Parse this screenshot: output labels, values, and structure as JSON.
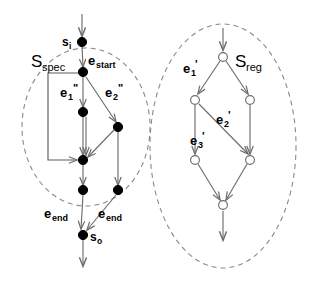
{
  "figure": {
    "type": "state-transition-graph-comparison",
    "background_color": "#ffffff",
    "edge_color": "#6d6d6d",
    "region_border_color": "#8a8a8a",
    "filled_node_color": "#000000",
    "hollow_node_fill": "#ffffff"
  },
  "regions": {
    "spec": {
      "label_main": "S",
      "label_sub": "spec",
      "node_style": "filled",
      "cx": 86,
      "cy": 127,
      "rx": 64,
      "ry": 79
    },
    "reg": {
      "label_main": "S",
      "label_sub": "reg",
      "node_style": "hollow",
      "cx": 223,
      "cy": 146,
      "rx": 73,
      "ry": 122
    }
  },
  "spec_graph": {
    "nodes": [
      {
        "id": "s_i",
        "x": 82,
        "y": 42,
        "style": "filled",
        "label_main": "s",
        "label_sub": "i"
      },
      {
        "id": "n_start",
        "x": 83,
        "y": 72,
        "style": "filled"
      },
      {
        "id": "n_l1",
        "x": 83,
        "y": 112,
        "style": "filled"
      },
      {
        "id": "n_r1",
        "x": 118,
        "y": 127,
        "style": "filled"
      },
      {
        "id": "n_merge",
        "x": 83,
        "y": 160,
        "style": "filled"
      },
      {
        "id": "n_l2",
        "x": 83,
        "y": 190,
        "style": "filled"
      },
      {
        "id": "n_r2",
        "x": 118,
        "y": 190,
        "style": "filled"
      },
      {
        "id": "s_o",
        "x": 83,
        "y": 235,
        "style": "filled",
        "label_main": "s",
        "label_sub": "o"
      }
    ],
    "edges": [
      {
        "from": "entry",
        "to": "s_i",
        "kind": "arrow"
      },
      {
        "from": "s_i",
        "to": "n_start",
        "kind": "arrow",
        "label_main": "e",
        "label_sub": "start"
      },
      {
        "from": "n_start",
        "to": "n_l1",
        "kind": "arrow",
        "label_main": "e",
        "label_sub": "1",
        "label_prime": "\""
      },
      {
        "from": "n_start",
        "to": "n_r1",
        "kind": "arrow",
        "label_main": "e",
        "label_sub": "2",
        "label_prime": "\""
      },
      {
        "from": "n_start",
        "to": "n_merge",
        "kind": "elbow-arrow"
      },
      {
        "from": "n_l1",
        "to": "n_merge",
        "kind": "arrow"
      },
      {
        "from": "n_r1",
        "to": "n_merge",
        "kind": "arrow"
      },
      {
        "from": "n_merge",
        "to": "n_l2",
        "kind": "arrow"
      },
      {
        "from": "n_r1",
        "to": "n_r2",
        "kind": "arrow"
      },
      {
        "from": "n_l2",
        "to": "s_o",
        "kind": "arrow",
        "label_main": "e",
        "label_sub": "end"
      },
      {
        "from": "n_r2",
        "to": "s_o",
        "kind": "arrow",
        "label_main": "e",
        "label_sub": "end"
      },
      {
        "from": "s_o",
        "to": "exit",
        "kind": "arrow"
      }
    ]
  },
  "reg_graph": {
    "nodes": [
      {
        "id": "r_top",
        "x": 223,
        "y": 57,
        "style": "hollow"
      },
      {
        "id": "r_left",
        "x": 195,
        "y": 100,
        "style": "hollow"
      },
      {
        "id": "r_right",
        "x": 250,
        "y": 100,
        "style": "hollow"
      },
      {
        "id": "r_bl",
        "x": 195,
        "y": 160,
        "style": "hollow"
      },
      {
        "id": "r_br",
        "x": 250,
        "y": 160,
        "style": "hollow"
      },
      {
        "id": "r_bot",
        "x": 223,
        "y": 205,
        "style": "hollow"
      }
    ],
    "edges": [
      {
        "from": "entry",
        "to": "r_top",
        "kind": "arrow"
      },
      {
        "from": "r_top",
        "to": "r_left",
        "kind": "arrow",
        "label_main": "e",
        "label_sub": "1",
        "label_prime": "'"
      },
      {
        "from": "r_top",
        "to": "r_right",
        "kind": "arrow"
      },
      {
        "from": "r_left",
        "to": "r_bl",
        "kind": "arrow",
        "label_main": "e",
        "label_sub": "3",
        "label_prime": "'"
      },
      {
        "from": "r_left",
        "to": "r_br",
        "kind": "arrow",
        "label_main": "e",
        "label_sub": "2",
        "label_prime": "'"
      },
      {
        "from": "r_right",
        "to": "r_br",
        "kind": "arrow"
      },
      {
        "from": "r_bl",
        "to": "r_bot",
        "kind": "arrow"
      },
      {
        "from": "r_br",
        "to": "r_bot",
        "kind": "arrow"
      },
      {
        "from": "r_bot",
        "to": "exit",
        "kind": "arrow"
      }
    ]
  },
  "labels": {
    "s_i_main": "s",
    "s_i_sub": "i",
    "s_o_main": "s",
    "s_o_sub": "o",
    "e_start_main": "e",
    "e_start_sub": "start",
    "e_end_left_main": "e",
    "e_end_left_sub": "end",
    "e_end_right_main": "e",
    "e_end_right_sub": "end",
    "e1dd_main": "e",
    "e1dd_sub": "1",
    "e1dd_prime": "\"",
    "e2dd_main": "e",
    "e2dd_sub": "2",
    "e2dd_prime": "\"",
    "e1p_main": "e",
    "e1p_sub": "1",
    "e1p_prime": "'",
    "e2p_main": "e",
    "e2p_sub": "2",
    "e2p_prime": "'",
    "e3p_main": "e",
    "e3p_sub": "3",
    "e3p_prime": "'",
    "sspec_main": "S",
    "sspec_sub": "spec",
    "sreg_main": "S",
    "sreg_sub": "reg"
  }
}
